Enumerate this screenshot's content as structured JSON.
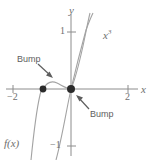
{
  "figure": {
    "background_color": "#ffffff",
    "curve_color": "#9a9a9a",
    "axis_color": "#8c8c8c",
    "dot_color": "#2b2b2b",
    "text_color": "#6e6e6e"
  },
  "axes": {
    "x_label": "x",
    "y_label": "y",
    "x_ticks": [
      {
        "value": -2,
        "label": "−2",
        "px": 13
      },
      {
        "value": 2,
        "label": "2",
        "px": 128
      }
    ],
    "y_ticks": [
      {
        "value": 1,
        "label": "1",
        "px": 32
      },
      {
        "value": -1,
        "label": "−1",
        "px": 146
      }
    ],
    "origin_px": {
      "x": 71,
      "y": 89
    },
    "unit_px": {
      "x": 28.5,
      "y": 57
    },
    "xlim": [
      -2.5,
      2.8
    ],
    "ylim": [
      -1.25,
      1.55
    ]
  },
  "curves": [
    {
      "name": "f(x)",
      "label": "f(x)",
      "description": "cubic-like curve with a local bump between x=-1 and 0, passing through (-1,0) and (0,0)"
    },
    {
      "name": "x^3",
      "label_main": "x",
      "label_exp": "3",
      "description": "standard cubic x cubed passing through origin"
    }
  ],
  "markers": [
    {
      "name": "left-root",
      "x": -1,
      "y": 0,
      "px": {
        "x": 43,
        "y": 89
      }
    },
    {
      "name": "origin-root",
      "x": 0,
      "y": 0,
      "px": {
        "x": 71,
        "y": 89
      }
    }
  ],
  "callouts": [
    {
      "id": "bump-upper-left",
      "text": "Bump",
      "label_px": {
        "x": 17,
        "y": 55
      },
      "arrow_from_px": {
        "x": 38,
        "y": 65
      },
      "arrow_to_px": {
        "x": 53,
        "y": 78
      }
    },
    {
      "id": "bump-lower-right",
      "text": "Bump",
      "label_px": {
        "x": 90,
        "y": 110
      },
      "arrow_from_px": {
        "x": 89,
        "y": 110
      },
      "arrow_to_px": {
        "x": 76,
        "y": 95
      }
    }
  ]
}
